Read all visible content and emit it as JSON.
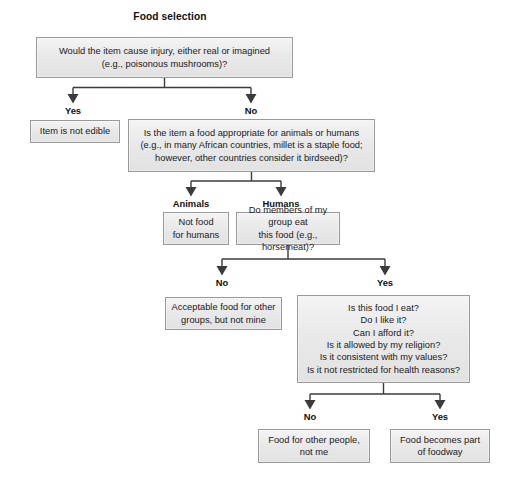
{
  "title": "Food selection",
  "nodes": {
    "q_injury": "Would the item cause injury, either real or imagined\n(e.g., poisonous mushrooms)?",
    "not_edible": "Item is not edible",
    "q_appropriate": "Is the item a food appropriate for animals or humans\n(e.g., in many African countries, millet is a staple food;\nhowever, other countries consider it birdseed)?",
    "not_food_humans": "Not food\nfor humans",
    "q_group_eat": "Do members of my group eat\nthis food (e.g., horsemeat)?",
    "acceptable_other": "Acceptable food for other\ngroups, but not mine",
    "q_personal": "Is this food I eat?\nDo I like it?\nCan I afford it?\nIs it allowed by my religion?\nIs it consistent with my values?\nIs it not restricted for health reasons?",
    "food_other_people": "Food for other people,\nnot me",
    "food_foodway": "Food becomes part\nof foodway"
  },
  "edge_labels": {
    "injury_yes": "Yes",
    "injury_no": "No",
    "appropriate_animals": "Animals",
    "appropriate_humans": "Humans",
    "group_no": "No",
    "group_yes": "Yes",
    "personal_no": "No",
    "personal_yes": "Yes"
  },
  "colors": {
    "box_fill": "#e9e9e9",
    "box_border": "#9a9a9a",
    "connector": "#3b3b3b",
    "text": "#1a1a1a",
    "background": "#ffffff"
  }
}
